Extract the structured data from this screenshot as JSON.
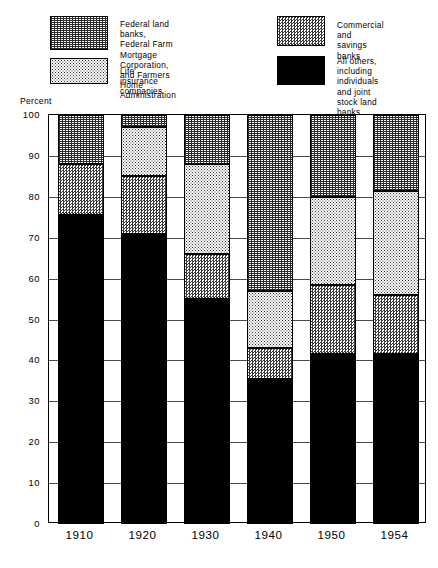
{
  "chart_data": {
    "type": "bar",
    "subtype": "stacked-100-percent",
    "title": "",
    "xlabel": "",
    "ylabel": "Percent",
    "ylim": [
      0,
      100
    ],
    "yticks": [
      0,
      10,
      20,
      30,
      40,
      50,
      60,
      70,
      80,
      90,
      100
    ],
    "ytick_labels": [
      "0",
      "10",
      "20",
      "30",
      "40",
      "50",
      "60",
      "70",
      "80",
      "90",
      "100"
    ],
    "grid": true,
    "legend_position": "top",
    "categories": [
      "1910",
      "1920",
      "1930",
      "1940",
      "1950",
      "1954"
    ],
    "series": [
      {
        "name": "All others, including individuals and joint stock land banks",
        "short_name": "all-others",
        "pattern": "solid-black",
        "color": "#000000",
        "values": [
          75.5,
          71.0,
          55.0,
          35.5,
          41.5,
          41.5
        ]
      },
      {
        "name": "Commercial and savings banks",
        "short_name": "commercial-savings",
        "pattern": "checkerboard",
        "color": "#3a3a3a",
        "values": [
          12.5,
          14.0,
          11.0,
          7.5,
          17.0,
          14.5
        ]
      },
      {
        "name": "Life insurance companies",
        "short_name": "life-insurance",
        "pattern": "light-dots",
        "color": "#333333",
        "values": [
          0.0,
          12.0,
          22.0,
          14.0,
          21.5,
          25.5
        ]
      },
      {
        "name": "Federal land banks, Federal Farm Mortgage Corporation, and Farmers Home Administration",
        "short_name": "federal-land-banks",
        "pattern": "dense-weave",
        "color": "#2b2b2b",
        "values": [
          12.0,
          3.0,
          12.0,
          43.0,
          20.0,
          18.5
        ]
      }
    ],
    "stack_boundaries": {
      "1910": [
        0,
        75.5,
        88.0,
        88.0,
        100
      ],
      "1920": [
        0,
        71.0,
        85.0,
        97.0,
        100
      ],
      "1930": [
        0,
        55.0,
        66.0,
        88.0,
        100
      ],
      "1940": [
        0,
        35.5,
        43.0,
        57.0,
        100
      ],
      "1950": [
        0,
        41.5,
        58.5,
        80.0,
        100
      ],
      "1954": [
        0,
        41.5,
        56.0,
        81.5,
        100
      ]
    }
  },
  "legend": {
    "items": [
      {
        "id": "federal-land-banks",
        "label": "Federal land banks,\nFederal Farm Mortgage Corporation,\nand Farmers Home Administration",
        "pattern": "dense-weave"
      },
      {
        "id": "life-insurance",
        "label": "Life insurance companies",
        "pattern": "light-dots"
      },
      {
        "id": "commercial-savings",
        "label": "Commercial and\nsavings banks",
        "pattern": "checkerboard"
      },
      {
        "id": "all-others",
        "label": "All others, including\nindividuals and joint\nstock land banks",
        "pattern": "solid-black"
      }
    ]
  },
  "axis": {
    "unit_label": "Percent"
  }
}
